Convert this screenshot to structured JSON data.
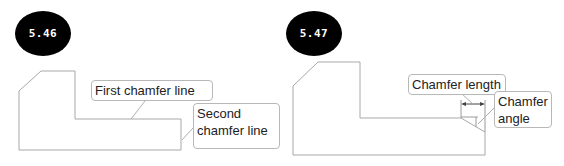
{
  "figures": [
    {
      "id": "5.46",
      "badge": "5.46",
      "callouts": {
        "first": "First chamfer line",
        "second_line1": "Second",
        "second_line2": "chamfer line"
      }
    },
    {
      "id": "5.47",
      "badge": "5.47",
      "callouts": {
        "length": "Chamfer length",
        "angle_line1": "Chamfer",
        "angle_line2": "angle"
      }
    }
  ],
  "colors": {
    "outline": "#a8a8a8",
    "leader": "#b0b0b0",
    "badge_bg": "#000000",
    "badge_text": "#ffffff",
    "dimension": "#444444"
  }
}
